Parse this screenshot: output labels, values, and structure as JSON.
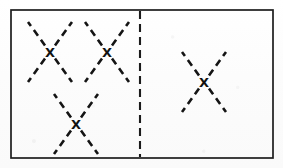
{
  "figure": {
    "canvas": {
      "width": 283,
      "height": 168,
      "background": "#fdfdfd"
    },
    "colors": {
      "ink": "#141414",
      "frame": "#1d1d1d",
      "divider": "#1b1b1b",
      "paper": "#fdfdfd"
    },
    "frame": {
      "label": "outer-rectangle",
      "x": 11,
      "y": 10,
      "width": 262,
      "height": 148,
      "stroke_width": 1.7,
      "style": "solid"
    },
    "divider": {
      "label": "vertical-dashed-divider",
      "x": 140,
      "y1": 11,
      "y2": 157,
      "style": "dashed",
      "dash_pattern": "8 5",
      "stroke_width": 2.1
    },
    "panels": [
      {
        "id": "left-panel",
        "label": "Left panel",
        "shape_count": 3,
        "bounds": {
          "x": 11,
          "y": 10,
          "width": 129,
          "height": 148
        }
      },
      {
        "id": "right-panel",
        "label": "Right panel",
        "shape_count": 1,
        "bounds": {
          "x": 140,
          "y": 10,
          "width": 133,
          "height": 148
        }
      }
    ],
    "shapes": [
      {
        "id": "x-shape-1",
        "label": "X figure top-left",
        "panel": "left-panel",
        "cx": 50,
        "cy": 52,
        "half_width": 22,
        "half_height": 30,
        "dash_pattern": "7 5",
        "centromere_glyph": "X"
      },
      {
        "id": "x-shape-2",
        "label": "X figure top-right",
        "panel": "left-panel",
        "cx": 107,
        "cy": 52,
        "half_width": 22,
        "half_height": 30,
        "dash_pattern": "7 5",
        "centromere_glyph": "X"
      },
      {
        "id": "x-shape-3",
        "label": "X figure bottom-center",
        "panel": "left-panel",
        "cx": 76,
        "cy": 124,
        "half_width": 22,
        "half_height": 30,
        "dash_pattern": "7 5",
        "centromere_glyph": "X"
      },
      {
        "id": "x-shape-4",
        "label": "X figure right panel",
        "panel": "right-panel",
        "cx": 204,
        "cy": 82,
        "half_width": 22,
        "half_height": 30,
        "dash_pattern": "7 5",
        "centromere_glyph": "X"
      }
    ]
  }
}
